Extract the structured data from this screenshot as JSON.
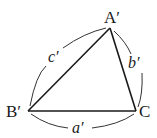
{
  "diagram": {
    "type": "triangle",
    "stroke_color": "#1a1a1a",
    "vertices": [
      {
        "id": "A",
        "label": "A′",
        "x": 110,
        "y": 28
      },
      {
        "id": "B",
        "label": "B′",
        "x": 28,
        "y": 111
      },
      {
        "id": "C",
        "label": "C",
        "x": 136,
        "y": 111
      }
    ],
    "sides": [
      {
        "id": "a",
        "label": "a′",
        "between": [
          "B",
          "C"
        ]
      },
      {
        "id": "b",
        "label": "b′",
        "between": [
          "A",
          "C"
        ]
      },
      {
        "id": "c",
        "label": "c′",
        "between": [
          "A",
          "B"
        ]
      }
    ]
  }
}
